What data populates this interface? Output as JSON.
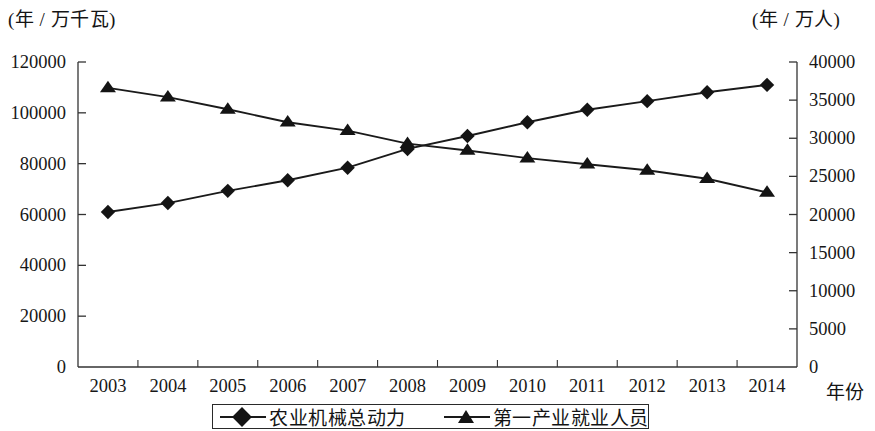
{
  "chart_data": {
    "type": "line",
    "title": "",
    "xlabel": "年份",
    "left_axis": {
      "unit_label": "(年 / 万千瓦)",
      "ticks": [
        "0",
        "20000",
        "40000",
        "60000",
        "80000",
        "100000",
        "120000"
      ],
      "min": 0,
      "max": 120000,
      "step": 20000
    },
    "right_axis": {
      "unit_label": "(年 / 万人)",
      "ticks": [
        "0",
        "5000",
        "10000",
        "15000",
        "20000",
        "25000",
        "30000",
        "35000",
        "40000"
      ],
      "min": 0,
      "max": 40000,
      "step": 5000
    },
    "categories": [
      "2003",
      "2004",
      "2005",
      "2006",
      "2007",
      "2008",
      "2009",
      "2010",
      "2011",
      "2012",
      "2013",
      "2014"
    ],
    "grid": false,
    "legend_position": "bottom",
    "series": [
      {
        "name": "农业机械总动力",
        "marker": "diamond",
        "axis": "left",
        "color": "#141414",
        "values": [
          61000,
          64500,
          69300,
          73500,
          78400,
          85800,
          90900,
          96300,
          101200,
          104600,
          108100,
          61000
        ]
      },
      {
        "name": "第一产业就业人员",
        "marker": "triangle",
        "axis": "right",
        "color": "#141414",
        "values": [
          36600,
          35400,
          33800,
          32100,
          31000,
          29300,
          28400,
          27400,
          26600,
          25800,
          24700,
          22900
        ]
      }
    ]
  },
  "series_left_values": [
    61000,
    64500,
    69300,
    73500,
    78400,
    85800,
    90900,
    96300,
    101200,
    104600,
    108100,
    111000
  ],
  "legend": {
    "items": [
      {
        "label": "农业机械总动力",
        "marker": "diamond"
      },
      {
        "label": "第一产业就业人员",
        "marker": "triangle"
      }
    ]
  },
  "axes": {
    "left_unit": "(年 / 万千瓦)",
    "right_unit": "(年 / 万人)",
    "x_name": "年份",
    "left_ticks": [
      "120000",
      "100000",
      "80000",
      "60000",
      "40000",
      "20000",
      "0"
    ],
    "right_ticks": [
      "40000",
      "35000",
      "30000",
      "25000",
      "20000",
      "15000",
      "10000",
      "5000",
      "0"
    ],
    "x_ticks": [
      "2003",
      "2004",
      "2005",
      "2006",
      "2007",
      "2008",
      "2009",
      "2010",
      "2011",
      "2012",
      "2013",
      "2014"
    ]
  }
}
